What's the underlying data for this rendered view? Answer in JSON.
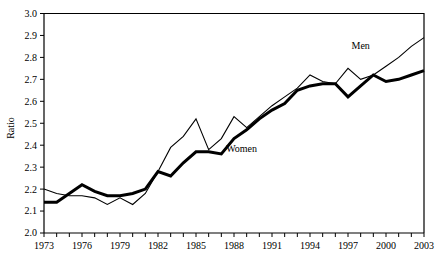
{
  "chart_data": {
    "type": "line",
    "title": "",
    "xlabel": "",
    "ylabel": "Ratio",
    "xlim": [
      1973,
      2003
    ],
    "ylim": [
      2.0,
      3.0
    ],
    "ytick_step": 0.1,
    "xtick_step": 1,
    "xtick_label_step": 3,
    "grid": false,
    "legend": "inline-labels",
    "x": [
      1973,
      1974,
      1975,
      1976,
      1977,
      1978,
      1979,
      1980,
      1981,
      1982,
      1983,
      1984,
      1985,
      1986,
      1987,
      1988,
      1989,
      1990,
      1991,
      1992,
      1993,
      1994,
      1995,
      1996,
      1997,
      1998,
      1999,
      2000,
      2001,
      2002,
      2003
    ],
    "series": [
      {
        "name": "Men",
        "label": "Men",
        "style": "thin",
        "values": [
          2.2,
          2.18,
          2.17,
          2.17,
          2.16,
          2.13,
          2.16,
          2.13,
          2.18,
          2.28,
          2.39,
          2.44,
          2.52,
          2.38,
          2.43,
          2.53,
          2.48,
          2.53,
          2.58,
          2.62,
          2.66,
          2.72,
          2.69,
          2.68,
          2.75,
          2.7,
          2.72,
          2.76,
          2.8,
          2.85,
          2.89
        ]
      },
      {
        "name": "Women",
        "label": "Women",
        "style": "thick",
        "values": [
          2.14,
          2.14,
          2.18,
          2.22,
          2.19,
          2.17,
          2.17,
          2.18,
          2.2,
          2.28,
          2.26,
          2.32,
          2.37,
          2.37,
          2.36,
          2.43,
          2.47,
          2.52,
          2.56,
          2.59,
          2.65,
          2.67,
          2.68,
          2.68,
          2.62,
          2.67,
          2.72,
          2.69,
          2.7,
          2.72,
          2.74
        ]
      }
    ],
    "ytick_labels": [
      "2.0",
      "2.1",
      "2.2",
      "2.3",
      "2.4",
      "2.5",
      "2.6",
      "2.7",
      "2.8",
      "2.9",
      "3.0"
    ],
    "xtick_labels": [
      "1973",
      "1976",
      "1979",
      "1982",
      "1985",
      "1988",
      "1991",
      "1994",
      "1997",
      "2000",
      "2003"
    ],
    "annotations": [
      {
        "text": "Men",
        "x": 1998.0,
        "y": 2.84
      },
      {
        "text": "Women",
        "x": 1988.6,
        "y": 2.37
      }
    ]
  }
}
